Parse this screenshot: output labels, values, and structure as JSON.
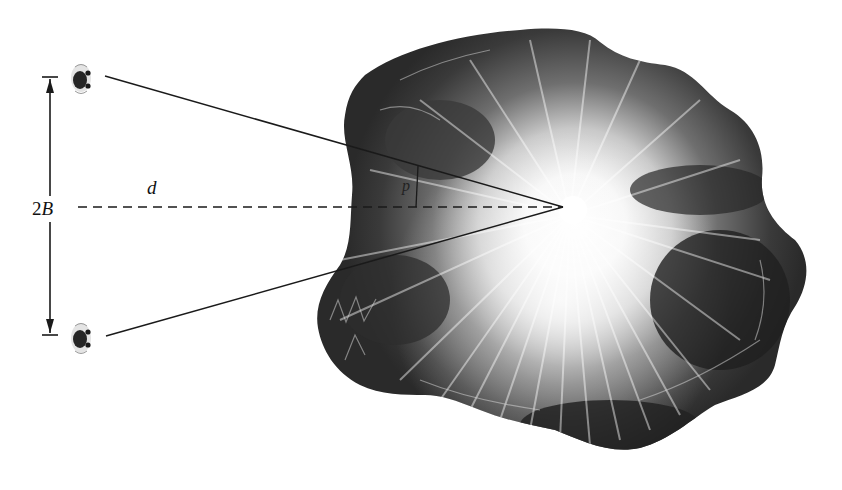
{
  "diagram": {
    "type": "stereo-parallax / triangulation",
    "labels": {
      "baseline": "2B",
      "baseline_number": "2",
      "baseline_var": "B",
      "distance": "d",
      "parallax": "p"
    },
    "observers": [
      {
        "name": "top-eye",
        "x": 81,
        "y": 79
      },
      {
        "name": "bottom-eye",
        "x": 81,
        "y": 338
      }
    ],
    "apex": {
      "x": 563,
      "y": 207
    },
    "baseline_arrow": {
      "x": 50,
      "y_top": 77,
      "y_bottom": 335
    },
    "colors": {
      "line": "#1a1a1a",
      "volcano_dark": "#2a2a2a",
      "volcano_mid": "#6e6e6e",
      "volcano_light": "#f4f4f4"
    }
  }
}
